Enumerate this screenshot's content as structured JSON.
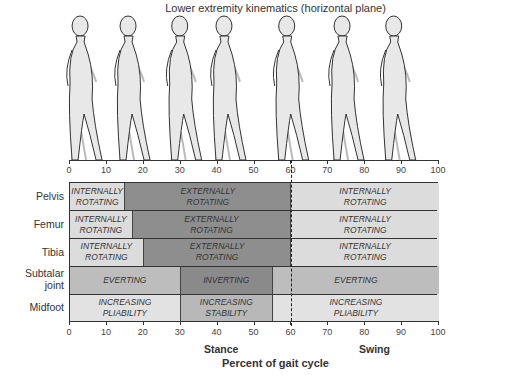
{
  "title": "Lower extremity kinematics (horizontal plane)",
  "x_axis": {
    "ticks": [
      "0",
      "10",
      "20",
      "30",
      "40",
      "50",
      "60",
      "70",
      "80",
      "90",
      "100"
    ],
    "label": "Percent of gait cycle",
    "phases": {
      "stance": "Stance",
      "swing": "Swing"
    },
    "divider_percent": 60
  },
  "figures": {
    "count": 7,
    "positions_percent": [
      3,
      16,
      30,
      42,
      59,
      74,
      88
    ]
  },
  "rows": [
    {
      "label": "Pelvis",
      "segments": [
        {
          "start": 0,
          "end": 15,
          "line1": "INTERNALLY",
          "line2": "ROTATING",
          "color": "#dcdcdc"
        },
        {
          "start": 15,
          "end": 60,
          "line1": "EXTERNALLY",
          "line2": "ROTATING",
          "color": "#8e8e8e"
        },
        {
          "start": 60,
          "end": 100,
          "line1": "INTERNALLY",
          "line2": "ROTATING",
          "color": "#dcdcdc"
        }
      ]
    },
    {
      "label": "Femur",
      "segments": [
        {
          "start": 0,
          "end": 17,
          "line1": "INTERNALLY",
          "line2": "ROTATING",
          "color": "#dcdcdc"
        },
        {
          "start": 17,
          "end": 60,
          "line1": "EXTERNALLY",
          "line2": "ROTATING",
          "color": "#8e8e8e"
        },
        {
          "start": 60,
          "end": 100,
          "line1": "INTERNALLY",
          "line2": "ROTATING",
          "color": "#dcdcdc"
        }
      ]
    },
    {
      "label": "Tibia",
      "segments": [
        {
          "start": 0,
          "end": 20,
          "line1": "INTERNALLY",
          "line2": "ROTATING",
          "color": "#dcdcdc"
        },
        {
          "start": 20,
          "end": 60,
          "line1": "EXTERNALLY",
          "line2": "ROTATING",
          "color": "#8e8e8e"
        },
        {
          "start": 60,
          "end": 100,
          "line1": "INTERNALLY",
          "line2": "ROTATING",
          "color": "#dcdcdc"
        }
      ]
    },
    {
      "label": "Subtalar joint",
      "label_line1": "Subtalar",
      "label_line2": "joint",
      "segments": [
        {
          "start": 0,
          "end": 30,
          "line1": "EVERTING",
          "line2": "",
          "color": "#bdbdbd"
        },
        {
          "start": 30,
          "end": 55,
          "line1": "INVERTING",
          "line2": "",
          "color": "#8a8a8a"
        },
        {
          "start": 55,
          "end": 100,
          "line1": "EVERTING",
          "line2": "",
          "color": "#bdbdbd"
        }
      ]
    },
    {
      "label": "Midfoot",
      "segments": [
        {
          "start": 0,
          "end": 30,
          "line1": "INCREASING",
          "line2": "PLIABILITY",
          "color": "#e2e2e2"
        },
        {
          "start": 30,
          "end": 55,
          "line1": "INCREASING",
          "line2": "STABILITY",
          "color": "#b8b8b8"
        },
        {
          "start": 55,
          "end": 100,
          "line1": "INCREASING",
          "line2": "PLIABILITY",
          "color": "#e2e2e2"
        }
      ]
    }
  ]
}
